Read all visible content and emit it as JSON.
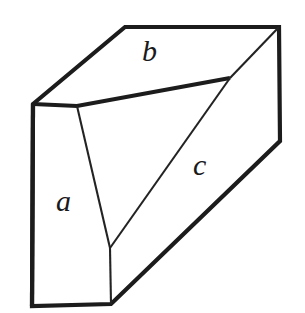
{
  "figure": {
    "kind": "geometry-diagram",
    "background_color": "#ffffff",
    "outline_color": "#1c1c1c",
    "inner_line_color": "#232323",
    "labels": {
      "a": "a",
      "b": "b",
      "c": "c"
    },
    "label_positions": {
      "a": {
        "x": 67,
        "y": 202
      },
      "b": {
        "x": 152,
        "y": 52
      },
      "c": {
        "x": 203,
        "y": 166
      }
    },
    "vertices": {
      "top_left_peak": {
        "x": 125,
        "y": 27
      },
      "top_right": {
        "x": 279,
        "y": 27
      },
      "left_corner": {
        "x": 33,
        "y": 104
      },
      "right_bend": {
        "x": 280,
        "y": 141
      },
      "inner_top_junction": {
        "x": 77,
        "y": 106
      },
      "inner_v_junction": {
        "x": 110,
        "y": 248
      },
      "inner_right_vertex": {
        "x": 230,
        "y": 78
      },
      "bottom_left": {
        "x": 32,
        "y": 306
      },
      "bottom_mid": {
        "x": 111,
        "y": 304
      }
    },
    "paths": {
      "outer_outline": "M 33,104 L 125,27 L 279,27 L 280,141 L 111,304 L 32,306 Z",
      "front_left_face": "M 33,104 L 77,106 L 110,248 L 111,304 L 32,306 Z",
      "top_face": "M 33,104 L 125,27 L 279,27 L 230,78 L 77,106 Z",
      "cut_triangle": "M 77,106 L 230,78 L 110,248 Z",
      "inner_edge_top": "M 33,104 L 77,106 L 230,78",
      "inner_edge_slant_a": "M 77,106 L 110,248",
      "inner_edge_slant_c": "M 110,248 L 230,78",
      "inner_edge_right_diagonal": "M 230,78 L 279,27",
      "inner_edge_bottom_vertical": "M 110,248 L 111,304"
    }
  }
}
